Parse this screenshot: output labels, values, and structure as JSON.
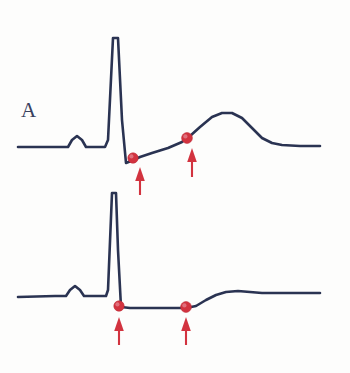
{
  "figure": {
    "background_color": "#fdfdfc",
    "width": 350,
    "height": 373
  },
  "style": {
    "trace_color": "#2a3352",
    "marker_color": "#d2333f",
    "arrow_color": "#d2333f",
    "label_color": "#39415e"
  },
  "panels": [
    {
      "id": "A",
      "label": "A",
      "label_x": 21,
      "label_y": 100,
      "baseline_y": 147,
      "finding": "ST segment elevation",
      "trace_points": "18,147 60,147 68,147 72,140 77,136 82,140 86,147 96,147 105,147 108,140 113,38 118,38 122,120 126,163 131,161 140,157 152,153 168,148 182,142 190,136 200,127 212,117 222,113 232,113 242,118 252,128 262,138 272,143 282,145 300,146 320,146",
      "markers": [
        {
          "name": "j-point-marker",
          "x": 133,
          "y": 158,
          "r": 5.2
        },
        {
          "name": "st-segment-marker",
          "x": 187,
          "y": 138,
          "r": 5.4
        }
      ],
      "arrows": [
        {
          "name": "j-point-arrow",
          "x": 140,
          "y_tip": 167,
          "y_tail": 195
        },
        {
          "name": "st-segment-arrow",
          "x": 192,
          "y_tip": 148,
          "y_tail": 177
        }
      ]
    },
    {
      "id": "B",
      "label": "B",
      "label_x": 21,
      "label_y": 255,
      "baseline_y": 296,
      "finding": "ST segment depression",
      "trace_points": "18,297 55,296 66,296 70,290 75,286 80,290 84,296 100,296 106,296 108,290 112,193 116,193 118,250 121,307 130,308 145,308 160,308 175,308 186,308 196,306 206,300 216,295 226,292 238,291 250,292 262,293 280,293 300,293 320,293",
      "markers": [
        {
          "name": "j-point-marker",
          "x": 119,
          "y": 306,
          "r": 5.2
        },
        {
          "name": "st-segment-marker",
          "x": 186,
          "y": 307,
          "r": 5.4
        }
      ],
      "arrows": [
        {
          "name": "j-point-arrow",
          "x": 119,
          "y_tip": 317,
          "y_tail": 345
        },
        {
          "name": "st-segment-arrow",
          "x": 186,
          "y_tip": 317,
          "y_tail": 345
        }
      ]
    }
  ],
  "chart_data": {
    "type": "line",
    "xlabel": "",
    "ylabel": "",
    "grid": false,
    "legend": "none",
    "series": [
      {
        "name": "A",
        "description": "ECG tracing with ST segment elevation and tall peaked T wave",
        "annotation_points": [
          {
            "label": "J point",
            "marker": "red dot",
            "arrow": "up"
          },
          {
            "label": "ST segment",
            "marker": "red dot",
            "arrow": "up"
          }
        ]
      },
      {
        "name": "B",
        "description": "ECG tracing with horizontal ST segment depression and flattened T wave",
        "annotation_points": [
          {
            "label": "J point",
            "marker": "red dot",
            "arrow": "up"
          },
          {
            "label": "ST segment",
            "marker": "red dot",
            "arrow": "up"
          }
        ]
      }
    ]
  }
}
